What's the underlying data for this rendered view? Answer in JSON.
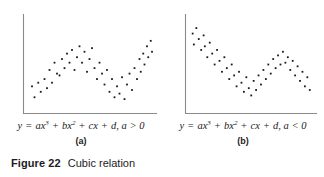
{
  "figure": {
    "number_label": "Figure 22",
    "title": "Cubic relation",
    "axis_color": "#8a8a8a",
    "point_color": "#1a1a1a",
    "background": "#ffffff"
  },
  "panels": [
    {
      "letter": "(a)",
      "equation": {
        "lhs": "y",
        "equals": "=",
        "term1_coef": "a",
        "term1_var": "x",
        "term1_exp": "3",
        "plus1": "+",
        "term2_coef": "b",
        "term2_var": "x",
        "term2_exp": "2",
        "plus2": "+",
        "term3_coef": "c",
        "term3_var": "x",
        "plus3": "+",
        "term4": "d,",
        "condition": "a > 0",
        "plain": "y = ax3 + bx2 + cx + d, a > 0"
      }
    },
    {
      "letter": "(b)",
      "equation": {
        "lhs": "y",
        "equals": "=",
        "term1_coef": "a",
        "term1_var": "x",
        "term1_exp": "3",
        "plus1": "+",
        "term2_coef": "b",
        "term2_var": "x",
        "term2_exp": "2",
        "plus2": "+",
        "term3_coef": "c",
        "term3_var": "x",
        "plus3": "+",
        "term4": "d,",
        "condition": "a < 0",
        "plain": "y = ax3 + bx2 + cx + d, a < 0"
      }
    }
  ],
  "chart_data": [
    {
      "type": "scatter",
      "title": "(a) Cubic relation, a > 0",
      "xlabel": "x",
      "ylabel": "y",
      "xlim": [
        0,
        100
      ],
      "ylim": [
        0,
        100
      ],
      "grid": false,
      "legend": null,
      "trend": "increasing cubic with local maximum then local minimum",
      "points": [
        [
          4,
          26
        ],
        [
          6,
          14
        ],
        [
          9,
          30
        ],
        [
          11,
          20
        ],
        [
          14,
          34
        ],
        [
          16,
          24
        ],
        [
          18,
          44
        ],
        [
          20,
          30
        ],
        [
          22,
          52
        ],
        [
          24,
          40
        ],
        [
          26,
          38
        ],
        [
          28,
          56
        ],
        [
          30,
          46
        ],
        [
          32,
          62
        ],
        [
          34,
          52
        ],
        [
          36,
          66
        ],
        [
          38,
          44
        ],
        [
          40,
          58
        ],
        [
          42,
          70
        ],
        [
          44,
          52
        ],
        [
          46,
          64
        ],
        [
          48,
          42
        ],
        [
          50,
          56
        ],
        [
          52,
          68
        ],
        [
          54,
          46
        ],
        [
          56,
          34
        ],
        [
          58,
          52
        ],
        [
          60,
          40
        ],
        [
          62,
          28
        ],
        [
          64,
          44
        ],
        [
          66,
          20
        ],
        [
          68,
          34
        ],
        [
          70,
          14
        ],
        [
          72,
          26
        ],
        [
          74,
          18
        ],
        [
          76,
          36
        ],
        [
          78,
          12
        ],
        [
          80,
          28
        ],
        [
          82,
          40
        ],
        [
          84,
          22
        ],
        [
          86,
          46
        ],
        [
          88,
          34
        ],
        [
          90,
          56
        ],
        [
          91,
          42
        ],
        [
          93,
          62
        ],
        [
          94,
          50
        ],
        [
          96,
          70
        ],
        [
          97,
          58
        ],
        [
          99,
          76
        ],
        [
          100,
          64
        ]
      ]
    },
    {
      "type": "scatter",
      "title": "(b) Cubic relation, a < 0",
      "xlabel": "x",
      "ylabel": "y",
      "xlim": [
        0,
        100
      ],
      "ylim": [
        0,
        100
      ],
      "grid": false,
      "legend": null,
      "trend": "decreasing cubic with local minimum then local maximum",
      "points": [
        [
          3,
          84
        ],
        [
          4,
          72
        ],
        [
          6,
          90
        ],
        [
          8,
          78
        ],
        [
          10,
          66
        ],
        [
          12,
          82
        ],
        [
          13,
          70
        ],
        [
          15,
          58
        ],
        [
          17,
          74
        ],
        [
          19,
          62
        ],
        [
          21,
          50
        ],
        [
          23,
          66
        ],
        [
          25,
          54
        ],
        [
          27,
          42
        ],
        [
          29,
          58
        ],
        [
          31,
          46
        ],
        [
          33,
          34
        ],
        [
          35,
          50
        ],
        [
          37,
          38
        ],
        [
          39,
          26
        ],
        [
          41,
          42
        ],
        [
          43,
          30
        ],
        [
          45,
          20
        ],
        [
          47,
          36
        ],
        [
          49,
          24
        ],
        [
          51,
          16
        ],
        [
          53,
          32
        ],
        [
          55,
          22
        ],
        [
          57,
          38
        ],
        [
          59,
          28
        ],
        [
          61,
          44
        ],
        [
          63,
          34
        ],
        [
          65,
          50
        ],
        [
          67,
          40
        ],
        [
          69,
          56
        ],
        [
          71,
          46
        ],
        [
          73,
          60
        ],
        [
          75,
          50
        ],
        [
          77,
          64
        ],
        [
          79,
          52
        ],
        [
          81,
          58
        ],
        [
          83,
          44
        ],
        [
          85,
          54
        ],
        [
          87,
          38
        ],
        [
          89,
          48
        ],
        [
          91,
          32
        ],
        [
          93,
          42
        ],
        [
          95,
          26
        ],
        [
          97,
          36
        ],
        [
          99,
          22
        ]
      ]
    }
  ]
}
